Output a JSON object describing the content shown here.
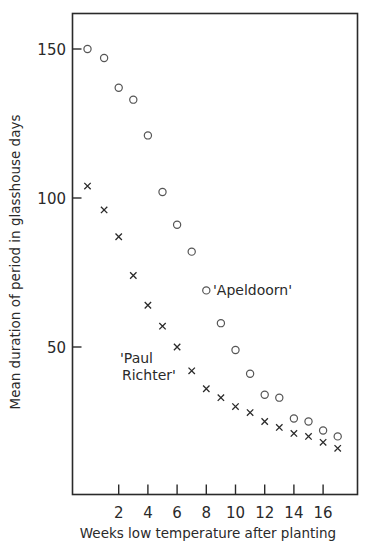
{
  "chart_data": {
    "type": "scatter",
    "title": "",
    "xlabel": "Weeks low temperature after planting",
    "ylabel": "Mean duration of period in glasshouse days",
    "xlim": [
      -1.2,
      18.5
    ],
    "ylim": [
      0,
      161
    ],
    "x_ticks": [
      2,
      4,
      6,
      8,
      10,
      12,
      14,
      16
    ],
    "x_tick_labels": [
      "2",
      "4",
      "6",
      "8",
      "10",
      "12",
      "14",
      "16"
    ],
    "y_ticks": [
      50,
      100,
      150
    ],
    "y_tick_labels": [
      "50",
      "100",
      "150"
    ],
    "grid": false,
    "legend": "none (series labelled by inline annotations)",
    "series": [
      {
        "name": "'Apeldoorn'",
        "marker": "circle",
        "x": [
          0,
          1,
          2,
          3,
          4,
          5,
          6,
          7,
          8,
          9,
          10,
          11,
          12,
          13,
          14,
          15,
          16,
          17
        ],
        "values": [
          150,
          147,
          137,
          133,
          121,
          102,
          91,
          82,
          69,
          58,
          49,
          41,
          34,
          33,
          26,
          25,
          22,
          20
        ]
      },
      {
        "name": "'Paul Richter'",
        "marker": "cross",
        "x": [
          0,
          1,
          2,
          3,
          4,
          5,
          6,
          7,
          8,
          9,
          10,
          11,
          12,
          13,
          14,
          15,
          16,
          17
        ],
        "values": [
          104,
          96,
          87,
          74,
          64,
          57,
          50,
          42,
          36,
          33,
          30,
          28,
          25,
          23,
          21,
          20,
          18,
          16
        ]
      }
    ],
    "annotations": [
      {
        "text": "'Apeldoorn'",
        "near_series": "'Apeldoorn'",
        "at_x": 8.5,
        "at_y": 69
      },
      {
        "text": "'Paul",
        "near_series": "'Paul Richter'",
        "at_x": 2.5,
        "at_y": 46
      },
      {
        "text": "Richter'",
        "near_series": "'Paul Richter'",
        "at_x": 2.6,
        "at_y": 41
      }
    ]
  },
  "labels": {
    "x_axis": "Weeks low temperature after planting",
    "y_axis": "Mean duration of period in glasshouse days",
    "apeldoorn": "'Apeldoorn'",
    "paul_line1": "'Paul",
    "paul_line2": "Richter'"
  },
  "colors": {
    "ink": "#2a2a2a",
    "marker_circle": "#555555",
    "marker_cross": "#2a2a2a",
    "background": "#ffffff"
  }
}
